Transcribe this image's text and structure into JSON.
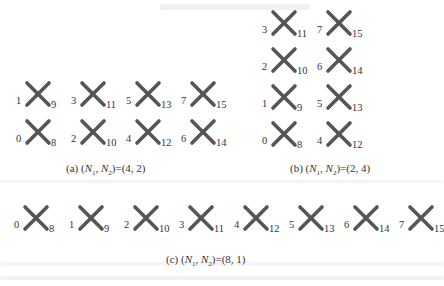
{
  "stroke_color": "#555555",
  "panels": [
    {
      "id": "a",
      "caption": {
        "prefix": "(a)",
        "n1": "N",
        "n1_sub": "1",
        "n2": "N",
        "n2_sub": "2",
        "value": "(4, 2)"
      },
      "rows": 2,
      "cols": 4,
      "elements": [
        {
          "left": "1",
          "right": "9"
        },
        {
          "left": "3",
          "right": "11"
        },
        {
          "left": "5",
          "right": "13"
        },
        {
          "left": "7",
          "right": "15"
        },
        {
          "left": "0",
          "right": "8"
        },
        {
          "left": "2",
          "right": "10"
        },
        {
          "left": "4",
          "right": "12"
        },
        {
          "left": "6",
          "right": "14"
        }
      ]
    },
    {
      "id": "b",
      "caption": {
        "prefix": "(b)",
        "n1": "N",
        "n1_sub": "1",
        "n2": "N",
        "n2_sub": "2",
        "value": "(2, 4)"
      },
      "rows": 4,
      "cols": 2,
      "elements": [
        {
          "left": "3",
          "right": "11"
        },
        {
          "left": "7",
          "right": "15"
        },
        {
          "left": "2",
          "right": "10"
        },
        {
          "left": "6",
          "right": "14"
        },
        {
          "left": "1",
          "right": "9"
        },
        {
          "left": "5",
          "right": "13"
        },
        {
          "left": "0",
          "right": "8"
        },
        {
          "left": "4",
          "right": "12"
        }
      ]
    },
    {
      "id": "c",
      "caption": {
        "prefix": "(c)",
        "n1": "N",
        "n1_sub": "1",
        "n2": "N",
        "n2_sub": "2",
        "value": "(8, 1)"
      },
      "rows": 1,
      "cols": 8,
      "elements": [
        {
          "left": "0",
          "right": "8"
        },
        {
          "left": "1",
          "right": "9"
        },
        {
          "left": "2",
          "right": "10"
        },
        {
          "left": "3",
          "right": "11"
        },
        {
          "left": "4",
          "right": "12"
        },
        {
          "left": "5",
          "right": "13"
        },
        {
          "left": "6",
          "right": "14"
        },
        {
          "left": "7",
          "right": "15"
        }
      ]
    }
  ]
}
